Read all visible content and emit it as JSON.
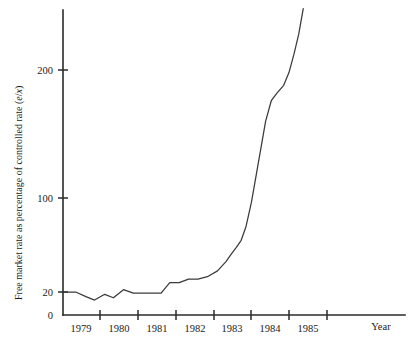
{
  "chart_data": {
    "type": "line",
    "title": "",
    "xlabel": "Year",
    "ylabel": "Free market rate as percentage of controlled rate (e/x)",
    "ylabel_parts": {
      "lead": "Free market rate as percentage of controlled rate (",
      "italic_numerator": "e",
      "slash": "/",
      "italic_denominator": "x",
      "close": ")"
    },
    "xtick_labels": [
      "1979",
      "1980",
      "1981",
      "1982",
      "1983",
      "1984",
      "1985"
    ],
    "xtick_values": [
      1979,
      1980,
      1981,
      1982,
      1983,
      1984,
      1985
    ],
    "ytick_labels": [
      "0",
      "20",
      "100",
      "200"
    ],
    "ytick_values": [
      0,
      20,
      100,
      200
    ],
    "xlim": [
      1978.6,
      1987.5
    ],
    "ylim": [
      0,
      260
    ],
    "grid": false,
    "legend": false,
    "series": [
      {
        "name": "Free market rate as percentage of controlled rate",
        "x": [
          1978.62,
          1978.95,
          1979.22,
          1979.45,
          1979.72,
          1979.95,
          1980.22,
          1980.48,
          1980.72,
          1980.95,
          1981.22,
          1981.45,
          1981.7,
          1981.95,
          1982.2,
          1982.45,
          1982.72,
          1982.95,
          1983.08,
          1983.22,
          1983.35,
          1983.48,
          1983.62,
          1983.75,
          1983.88,
          1984.0,
          1984.15,
          1984.3,
          1984.48,
          1984.62,
          1984.75,
          1984.88,
          1985.0
        ],
        "y": [
          20,
          20,
          16,
          13,
          18,
          15,
          22,
          19,
          19,
          19,
          19,
          28,
          28,
          31,
          31,
          33,
          38,
          46,
          52,
          58,
          64,
          76,
          96,
          118,
          140,
          160,
          176,
          182,
          188,
          198,
          212,
          228,
          248
        ]
      }
    ]
  },
  "geometry": {
    "plot_left": 63,
    "plot_right": 405,
    "plot_top": 10,
    "axis_baseline_y": 315,
    "year_pixel_step": 37.6,
    "year_origin_px": 62.6,
    "ytick_px": {
      "0": 315,
      "20": 292,
      "100": 198,
      "200": 70
    },
    "xtick_px": [
      100,
      138,
      176,
      214,
      251,
      289,
      327
    ],
    "curve_end_px": {
      "x": 313,
      "y": 28
    }
  },
  "style": {
    "line_color": "#3a3a3a",
    "axis_color": "#2b2b2b",
    "text_color": "#1a1a1a",
    "background": "#ffffff"
  }
}
